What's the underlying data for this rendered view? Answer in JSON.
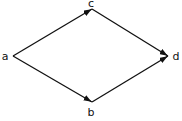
{
  "diagram": {
    "type": "directed-graph",
    "stroke_color": "#111111",
    "background": "#ffffff",
    "nodes": [
      {
        "id": "a",
        "label": "a",
        "x": 13,
        "y": 56,
        "label_x": 5,
        "label_y": 56
      },
      {
        "id": "c",
        "label": "c",
        "x": 92,
        "y": 9,
        "label_x": 91,
        "label_y": 3
      },
      {
        "id": "d",
        "label": "d",
        "x": 168,
        "y": 56,
        "label_x": 176,
        "label_y": 56
      },
      {
        "id": "b",
        "label": "b",
        "x": 92,
        "y": 102,
        "label_x": 91,
        "label_y": 112
      }
    ],
    "edges": [
      {
        "from": "a",
        "to": "c"
      },
      {
        "from": "c",
        "to": "d"
      },
      {
        "from": "a",
        "to": "b"
      },
      {
        "from": "b",
        "to": "d"
      }
    ]
  }
}
